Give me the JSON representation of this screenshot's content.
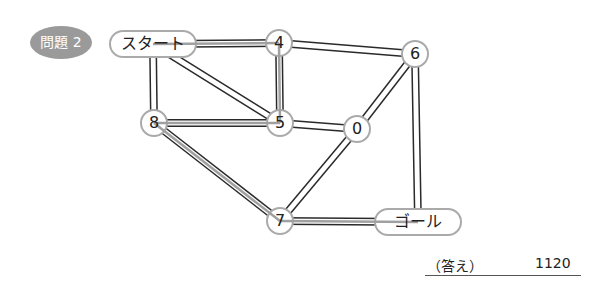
{
  "badge": {
    "label": "問題 2",
    "color": "#9a9a9a"
  },
  "nodes": [
    {
      "id": "start",
      "label": "スタート",
      "shape": "pill",
      "x": 153,
      "y": 44,
      "w": 86,
      "h": 26
    },
    {
      "id": "n4",
      "label": "4",
      "shape": "circle",
      "x": 279,
      "y": 43,
      "r": 13
    },
    {
      "id": "n6",
      "label": "6",
      "shape": "circle",
      "x": 415,
      "y": 54,
      "r": 13
    },
    {
      "id": "n8",
      "label": "8",
      "shape": "circle",
      "x": 154,
      "y": 123,
      "r": 13
    },
    {
      "id": "n5",
      "label": "5",
      "shape": "circle",
      "x": 280,
      "y": 123,
      "r": 13
    },
    {
      "id": "n0",
      "label": "0",
      "shape": "circle",
      "x": 357,
      "y": 129,
      "r": 13
    },
    {
      "id": "n7",
      "label": "7",
      "shape": "circle",
      "x": 280,
      "y": 221,
      "r": 13
    },
    {
      "id": "goal",
      "label": "ゴール",
      "shape": "pill",
      "x": 418,
      "y": 222,
      "w": 86,
      "h": 26
    }
  ],
  "edges": [
    {
      "from": "start",
      "to": "n4",
      "highlighted": true
    },
    {
      "from": "start",
      "to": "n8",
      "highlighted": false
    },
    {
      "from": "start",
      "to": "n5",
      "highlighted": false
    },
    {
      "from": "n4",
      "to": "n5",
      "highlighted": true
    },
    {
      "from": "n4",
      "to": "n6",
      "highlighted": false
    },
    {
      "from": "n8",
      "to": "n5",
      "highlighted": true
    },
    {
      "from": "n8",
      "to": "n7",
      "highlighted": true
    },
    {
      "from": "n5",
      "to": "n0",
      "highlighted": false
    },
    {
      "from": "n0",
      "to": "n6",
      "highlighted": false
    },
    {
      "from": "n0",
      "to": "n7",
      "highlighted": false
    },
    {
      "from": "n6",
      "to": "goal",
      "highlighted": false
    },
    {
      "from": "n7",
      "to": "goal",
      "highlighted": true
    }
  ],
  "answer": {
    "label": "（答え）",
    "value": "1120"
  },
  "colors": {
    "edge": "#2a2a2a",
    "highlight": "#a0a0a0",
    "node_border": "#aaaaaa"
  }
}
